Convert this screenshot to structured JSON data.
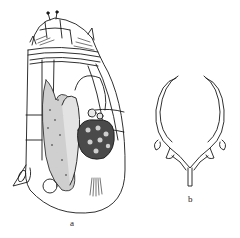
{
  "figure": {
    "panels": [
      {
        "id": "a",
        "label": "a",
        "subject": "rotifer-body-lateral-view"
      },
      {
        "id": "b",
        "label": "b",
        "subject": "trophi-jaw-apparatus"
      }
    ],
    "colors": {
      "ink": "#1a1a1a",
      "paper": "#ffffff"
    }
  }
}
